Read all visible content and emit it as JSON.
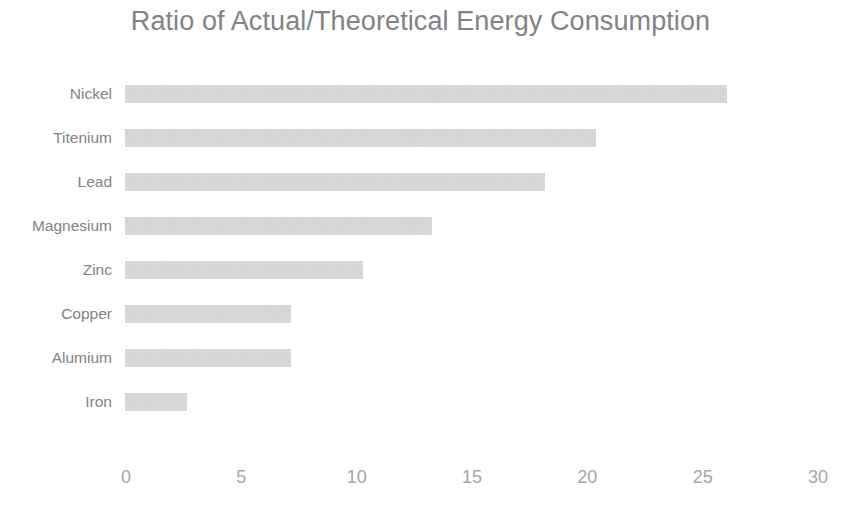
{
  "chart_data": {
    "type": "bar",
    "orientation": "horizontal",
    "title": "Ratio of Actual/Theoretical Energy Consumption",
    "xlabel": "",
    "ylabel": "",
    "xlim": [
      0,
      30
    ],
    "grid": false,
    "legend": false,
    "bar_color": "#c9cacb",
    "text_color": "#808286",
    "tick_color": "#a3a5a8",
    "background": "#ffffff",
    "xticks": [
      "0",
      "5",
      "10",
      "15",
      "20",
      "25",
      "30"
    ],
    "xtick_values": [
      0,
      5,
      10,
      15,
      20,
      25,
      30
    ],
    "categories": [
      "Nickel",
      "Titenium",
      "Lead",
      "Magnesium",
      "Zinc",
      "Copper",
      "Alumium",
      "Iron"
    ],
    "values": [
      26.1,
      20.4,
      18.2,
      13.3,
      10.3,
      7.2,
      7.2,
      2.7
    ],
    "bars": [
      {
        "label": "Nickel",
        "value": 26.1
      },
      {
        "label": "Titenium",
        "value": 20.4
      },
      {
        "label": "Lead",
        "value": 18.2
      },
      {
        "label": "Magnesium",
        "value": 13.3
      },
      {
        "label": "Zinc",
        "value": 10.3
      },
      {
        "label": "Copper",
        "value": 7.2
      },
      {
        "label": "Alumium",
        "value": 7.2
      },
      {
        "label": "Iron",
        "value": 2.7
      }
    ]
  }
}
